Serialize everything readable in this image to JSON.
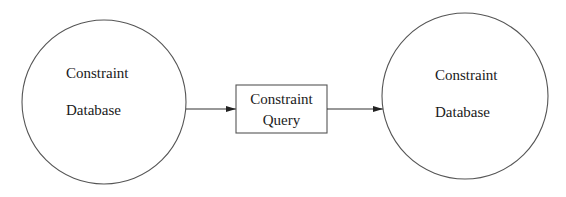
{
  "diagram": {
    "nodes": [
      {
        "id": "source_db",
        "shape": "circle",
        "lines": [
          "Constraint",
          "Database"
        ]
      },
      {
        "id": "query",
        "shape": "rectangle",
        "lines": [
          "Constraint",
          "Query"
        ]
      },
      {
        "id": "result_db",
        "shape": "circle",
        "lines": [
          "Constraint",
          "Database"
        ]
      }
    ],
    "edges": [
      {
        "from": "source_db",
        "to": "query",
        "style": "arrow"
      },
      {
        "from": "query",
        "to": "result_db",
        "style": "arrow"
      }
    ],
    "colors": {
      "stroke": "#555555",
      "text": "#1a1a1a",
      "background": "#ffffff"
    }
  }
}
